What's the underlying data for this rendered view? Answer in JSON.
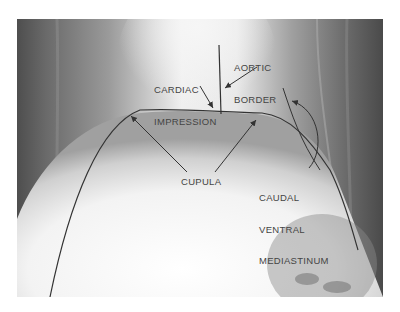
{
  "figure": {
    "type": "radiograph",
    "view": "ventrodorsal thorax/abdomen",
    "labels": {
      "aortic_border_line1": "AORTIC",
      "aortic_border_line2": "BORDER",
      "cardiac_impression_line1": "CARDIAC",
      "cardiac_impression_line2": "IMPRESSION",
      "cupula": "CUPULA",
      "caudal_ventral_line1": "CAUDAL",
      "caudal_ventral_line2": "VENTRAL",
      "caudal_ventral_line3": "MEDIASTINUM"
    },
    "colors": {
      "background": "#ffffff",
      "label_text": "#444444",
      "annotation_line": "#333333",
      "xray_dark": "#4a4a4a",
      "xray_light": "#f4f4f4"
    }
  }
}
